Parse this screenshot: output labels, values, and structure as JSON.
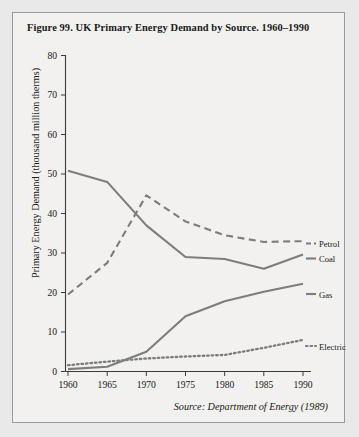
{
  "figure": {
    "title": "Figure 99.  UK Primary Energy Demand by Source. 1960–1990",
    "source": "Source: Department of Energy (1989)"
  },
  "chart_data": {
    "type": "line",
    "title": "Figure 99.  UK Primary Energy Demand by Source. 1960–1990",
    "xlabel": "",
    "ylabel": "Primary Energy Demand (thousand million therms)",
    "x": [
      1960,
      1965,
      1970,
      1975,
      1980,
      1985,
      1990
    ],
    "xtick_labels": [
      "1960",
      "1965",
      "1970",
      "1975",
      "1980",
      "1985",
      "1990"
    ],
    "ytick_labels": [
      "0",
      "10",
      "20",
      "30",
      "40",
      "50",
      "60",
      "70",
      "80"
    ],
    "yticks": [
      0,
      10,
      20,
      30,
      40,
      50,
      60,
      70,
      80
    ],
    "xlim": [
      1960,
      1990
    ],
    "ylim": [
      0,
      80
    ],
    "grid": false,
    "legend_position": "right-inline",
    "series": [
      {
        "name": "Coal",
        "style": "solid",
        "color": "#7d7d7d",
        "values": [
          50.8,
          48.0,
          37.0,
          29.0,
          28.5,
          26.0,
          29.6
        ]
      },
      {
        "name": "Petrol",
        "style": "dashed",
        "color": "#7d7d7d",
        "values": [
          19.5,
          27.5,
          44.6,
          38.0,
          34.5,
          32.8,
          33.0
        ]
      },
      {
        "name": "Gas",
        "style": "solid",
        "color": "#7d7d7d",
        "values": [
          0.6,
          1.2,
          5.0,
          14.0,
          17.8,
          20.2,
          22.2
        ]
      },
      {
        "name": "Electricity",
        "style": "dotted",
        "color": "#7d7d7d",
        "values": [
          1.6,
          2.5,
          3.3,
          3.8,
          4.2,
          6.0,
          8.0
        ]
      }
    ]
  },
  "axis": {
    "y_title": "Primary Energy Demand (thousand million therms)",
    "y_ticks": [
      "80",
      "70",
      "60",
      "50",
      "40",
      "30",
      "20",
      "10",
      "0"
    ],
    "x_ticks": [
      "1960",
      "1965",
      "1970",
      "1975",
      "1980",
      "1985",
      "1990"
    ]
  },
  "legend": {
    "petrol": "Petrol",
    "coal": "Coal",
    "gas": "Gas",
    "electricity": "Electricity"
  },
  "colors": {
    "page_background": "#e9e9e9",
    "panel_background": "#f2f1ef",
    "panel_border": "#9a9a9a",
    "series_gray": "#7d7d7d",
    "axis": "#3b3b3b",
    "text": "#1a1a1a"
  }
}
